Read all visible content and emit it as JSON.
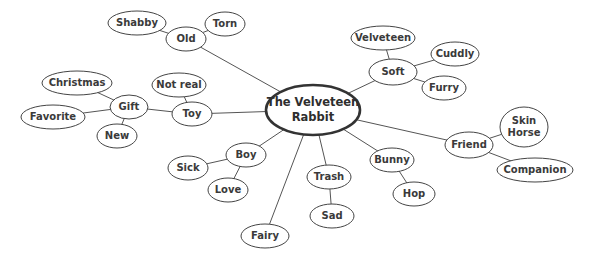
{
  "diagram": {
    "title": "The Velveteen Rabbit",
    "type": "mind-map",
    "colors": {
      "stroke": "#444444",
      "text": "#3a3a3a",
      "background": "#ffffff"
    },
    "nodes": [
      {
        "id": "root",
        "label": "The Velveteen\nRabbit",
        "cx": 313,
        "cy": 110,
        "rx": 47,
        "ry": 25,
        "root": true
      },
      {
        "id": "old",
        "label": "Old",
        "cx": 186,
        "cy": 39,
        "rx": 20,
        "ry": 12
      },
      {
        "id": "shabby",
        "label": "Shabby",
        "cx": 137,
        "cy": 23,
        "rx": 29,
        "ry": 12
      },
      {
        "id": "torn",
        "label": "Torn",
        "cx": 225,
        "cy": 24,
        "rx": 20,
        "ry": 12
      },
      {
        "id": "soft",
        "label": "Soft",
        "cx": 393,
        "cy": 72,
        "rx": 24,
        "ry": 13
      },
      {
        "id": "velveteen",
        "label": "Velveteen",
        "cx": 383,
        "cy": 38,
        "rx": 32,
        "ry": 12
      },
      {
        "id": "cuddly",
        "label": "Cuddly",
        "cx": 455,
        "cy": 54,
        "rx": 24,
        "ry": 12
      },
      {
        "id": "furry",
        "label": "Furry",
        "cx": 444,
        "cy": 88,
        "rx": 22,
        "ry": 12
      },
      {
        "id": "toy",
        "label": "Toy",
        "cx": 192,
        "cy": 114,
        "rx": 20,
        "ry": 12
      },
      {
        "id": "notreal",
        "label": "Not real",
        "cx": 179,
        "cy": 85,
        "rx": 27,
        "ry": 12
      },
      {
        "id": "gift",
        "label": "Gift",
        "cx": 129,
        "cy": 107,
        "rx": 19,
        "ry": 12
      },
      {
        "id": "christmas",
        "label": "Christmas",
        "cx": 77,
        "cy": 83,
        "rx": 35,
        "ry": 12
      },
      {
        "id": "favorite",
        "label": "Favorite",
        "cx": 53,
        "cy": 117,
        "rx": 32,
        "ry": 12
      },
      {
        "id": "new",
        "label": "New",
        "cx": 117,
        "cy": 136,
        "rx": 20,
        "ry": 12
      },
      {
        "id": "friend",
        "label": "Friend",
        "cx": 469,
        "cy": 145,
        "rx": 24,
        "ry": 13
      },
      {
        "id": "skinhorse",
        "label": "Skin\nHorse",
        "cx": 524,
        "cy": 127,
        "rx": 24,
        "ry": 20
      },
      {
        "id": "companion",
        "label": "Companion",
        "cx": 535,
        "cy": 170,
        "rx": 38,
        "ry": 12
      },
      {
        "id": "boy",
        "label": "Boy",
        "cx": 246,
        "cy": 155,
        "rx": 20,
        "ry": 12
      },
      {
        "id": "sick",
        "label": "Sick",
        "cx": 188,
        "cy": 168,
        "rx": 20,
        "ry": 12
      },
      {
        "id": "love",
        "label": "Love",
        "cx": 228,
        "cy": 190,
        "rx": 20,
        "ry": 12
      },
      {
        "id": "fairy",
        "label": "Fairy",
        "cx": 265,
        "cy": 236,
        "rx": 24,
        "ry": 12
      },
      {
        "id": "trash",
        "label": "Trash",
        "cx": 329,
        "cy": 177,
        "rx": 22,
        "ry": 12
      },
      {
        "id": "sad",
        "label": "Sad",
        "cx": 332,
        "cy": 216,
        "rx": 22,
        "ry": 12
      },
      {
        "id": "bunny",
        "label": "Bunny",
        "cx": 392,
        "cy": 160,
        "rx": 22,
        "ry": 12
      },
      {
        "id": "hop",
        "label": "Hop",
        "cx": 414,
        "cy": 194,
        "rx": 21,
        "ry": 12
      }
    ],
    "edges": [
      [
        "root",
        "old"
      ],
      [
        "old",
        "shabby"
      ],
      [
        "old",
        "torn"
      ],
      [
        "root",
        "soft"
      ],
      [
        "soft",
        "velveteen"
      ],
      [
        "soft",
        "cuddly"
      ],
      [
        "soft",
        "furry"
      ],
      [
        "root",
        "toy"
      ],
      [
        "toy",
        "notreal"
      ],
      [
        "toy",
        "gift"
      ],
      [
        "gift",
        "christmas"
      ],
      [
        "gift",
        "favorite"
      ],
      [
        "gift",
        "new"
      ],
      [
        "root",
        "friend"
      ],
      [
        "friend",
        "skinhorse"
      ],
      [
        "friend",
        "companion"
      ],
      [
        "root",
        "boy"
      ],
      [
        "boy",
        "sick"
      ],
      [
        "boy",
        "love"
      ],
      [
        "root",
        "fairy"
      ],
      [
        "root",
        "trash"
      ],
      [
        "trash",
        "sad"
      ],
      [
        "root",
        "bunny"
      ],
      [
        "bunny",
        "hop"
      ]
    ]
  }
}
